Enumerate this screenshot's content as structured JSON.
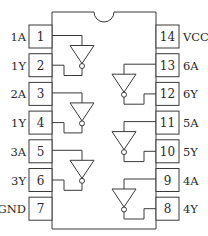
{
  "diagram": {
    "title": "",
    "type": "ic-pinout-hex-inverter",
    "colors": {
      "line": "#3a3a3a",
      "text": "#2a2a2a",
      "background": "#ffffff"
    }
  },
  "pins": {
    "left": [
      {
        "number": "1",
        "label": "1A"
      },
      {
        "number": "2",
        "label": "1Y"
      },
      {
        "number": "3",
        "label": "2A"
      },
      {
        "number": "4",
        "label": "1Y"
      },
      {
        "number": "5",
        "label": "3A"
      },
      {
        "number": "6",
        "label": "3Y"
      },
      {
        "number": "7",
        "label": "GND"
      }
    ],
    "right": [
      {
        "number": "14",
        "label": "VCC"
      },
      {
        "number": "13",
        "label": "6A"
      },
      {
        "number": "12",
        "label": "6Y"
      },
      {
        "number": "11",
        "label": "5A"
      },
      {
        "number": "10",
        "label": "5Y"
      },
      {
        "number": "9",
        "label": "4A"
      },
      {
        "number": "8",
        "label": "4Y"
      }
    ]
  },
  "gates": [
    {
      "name": "inverter-1",
      "side": "left",
      "input_pin": "1",
      "output_pin": "2"
    },
    {
      "name": "inverter-2",
      "side": "left",
      "input_pin": "3",
      "output_pin": "4"
    },
    {
      "name": "inverter-3",
      "side": "left",
      "input_pin": "5",
      "output_pin": "6"
    },
    {
      "name": "inverter-6",
      "side": "right",
      "input_pin": "13",
      "output_pin": "12"
    },
    {
      "name": "inverter-5",
      "side": "right",
      "input_pin": "11",
      "output_pin": "10"
    },
    {
      "name": "inverter-4",
      "side": "right",
      "input_pin": "9",
      "output_pin": "8"
    }
  ]
}
